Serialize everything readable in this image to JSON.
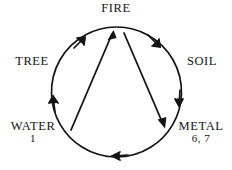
{
  "diagram": {
    "stroke_color": "#141414",
    "background_color": "#ffffff",
    "nodes": [
      {
        "id": "fire",
        "label": "FIRE",
        "number": ""
      },
      {
        "id": "soil",
        "label": "SOIL",
        "number": ""
      },
      {
        "id": "metal",
        "label": "METAL",
        "number": "6, 7"
      },
      {
        "id": "water",
        "label": "WATER",
        "number": "1"
      },
      {
        "id": "tree",
        "label": "TREE",
        "number": ""
      }
    ],
    "cycle_arrows": [
      {
        "from": "water",
        "to": "tree",
        "shape": "arc",
        "direction": "clockwise"
      },
      {
        "from": "tree",
        "to": "fire",
        "shape": "arc",
        "direction": "clockwise"
      },
      {
        "from": "fire",
        "to": "soil",
        "shape": "arc",
        "direction": "clockwise"
      },
      {
        "from": "soil",
        "to": "metal",
        "shape": "arc",
        "direction": "clockwise"
      },
      {
        "from": "metal",
        "to": "water",
        "shape": "arc",
        "direction": "clockwise"
      }
    ],
    "chord_arrows": [
      {
        "from": "water",
        "to": "fire",
        "shape": "straight"
      },
      {
        "from": "fire",
        "to": "metal",
        "shape": "straight"
      }
    ]
  }
}
